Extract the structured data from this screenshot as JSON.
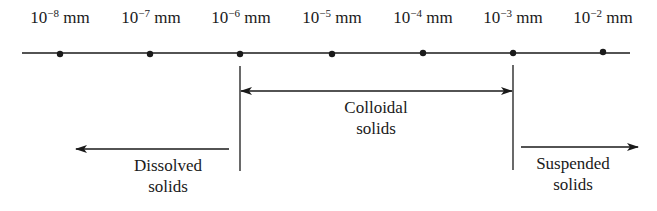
{
  "diagram": {
    "type": "size-scale",
    "unit": "mm",
    "ticks": [
      {
        "base": "10",
        "exponent": "−8",
        "unit": "mm",
        "x": 60
      },
      {
        "base": "10",
        "exponent": "−7",
        "unit": "mm",
        "x": 150
      },
      {
        "base": "10",
        "exponent": "−6",
        "unit": "mm",
        "x": 240
      },
      {
        "base": "10",
        "exponent": "−5",
        "unit": "mm",
        "x": 332
      },
      {
        "base": "10",
        "exponent": "−4",
        "unit": "mm",
        "x": 423
      },
      {
        "base": "10",
        "exponent": "−3",
        "unit": "mm",
        "x": 513
      },
      {
        "base": "10",
        "exponent": "−2",
        "unit": "mm",
        "x": 603
      }
    ],
    "regions": {
      "dissolved": {
        "line1": "Dissolved",
        "line2": "solids",
        "range": "< 10^-6 mm"
      },
      "colloidal": {
        "line1": "Colloidal",
        "line2": "solids",
        "range": "10^-6 mm to 10^-3 mm"
      },
      "suspended": {
        "line1": "Suspended",
        "line2": "solids",
        "range": "> 10^-3 mm"
      }
    },
    "colors": {
      "line": "#1a1a1a",
      "background": "#ffffff"
    }
  }
}
